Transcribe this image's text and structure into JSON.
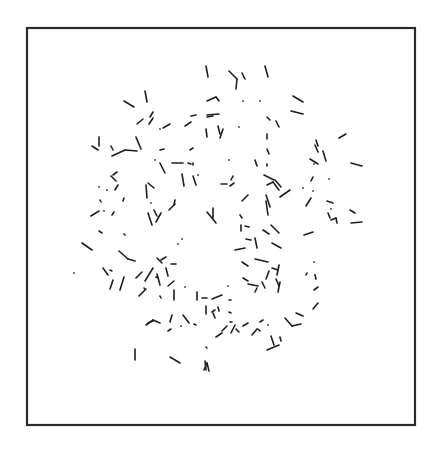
{
  "diagram": {
    "canvas": {
      "width": 430,
      "height": 449
    },
    "frame": {
      "x": 27,
      "y": 28,
      "width": 388,
      "height": 397,
      "stroke": "#2a2a2a"
    },
    "segment_color": "#1e1e1e",
    "segments": [
      [
        206,
        66,
        208,
        77
      ],
      [
        229,
        71,
        237,
        79
      ],
      [
        237,
        79,
        236,
        89
      ],
      [
        242,
        73,
        245,
        79
      ],
      [
        265,
        66,
        268,
        77
      ],
      [
        124,
        101,
        134,
        107
      ],
      [
        145,
        91,
        147,
        102
      ],
      [
        293,
        96,
        303,
        102
      ],
      [
        291,
        111,
        303,
        114
      ],
      [
        207,
        101,
        216,
        97
      ],
      [
        216,
        97,
        219,
        101
      ],
      [
        207,
        115,
        219,
        114
      ],
      [
        207,
        117,
        213,
        116
      ],
      [
        137,
        124,
        143,
        119
      ],
      [
        150,
        117,
        153,
        112
      ],
      [
        149,
        124,
        153,
        118
      ],
      [
        163,
        128,
        170,
        124
      ],
      [
        185,
        126,
        191,
        122
      ],
      [
        191,
        116,
        196,
        115
      ],
      [
        206,
        129,
        207,
        137
      ],
      [
        218,
        126,
        220,
        134
      ],
      [
        220,
        138,
        223,
        129
      ],
      [
        267,
        134,
        267,
        139
      ],
      [
        267,
        117,
        270,
        120
      ],
      [
        276,
        121,
        279,
        127
      ],
      [
        316,
        140,
        318,
        146
      ],
      [
        315,
        145,
        318,
        152
      ],
      [
        323,
        151,
        326,
        161
      ],
      [
        339,
        138,
        346,
        134
      ],
      [
        351,
        163,
        362,
        166
      ],
      [
        310,
        159,
        318,
        164
      ],
      [
        92,
        146,
        98,
        150
      ],
      [
        99,
        137,
        99,
        146
      ],
      [
        111,
        146,
        113,
        150
      ],
      [
        112,
        156,
        125,
        150
      ],
      [
        125,
        150,
        137,
        151
      ],
      [
        136,
        137,
        141,
        149
      ],
      [
        160,
        150,
        164,
        149
      ],
      [
        190,
        150,
        193,
        148
      ],
      [
        172,
        163,
        183,
        163
      ],
      [
        188,
        163,
        191,
        164
      ],
      [
        160,
        163,
        165,
        173
      ],
      [
        193,
        163,
        193,
        165
      ],
      [
        113,
        175,
        117,
        172
      ],
      [
        111,
        176,
        116,
        181
      ],
      [
        115,
        190,
        118,
        185
      ],
      [
        148,
        183,
        154,
        188
      ],
      [
        146,
        185,
        147,
        198
      ],
      [
        182,
        174,
        184,
        186
      ],
      [
        193,
        176,
        196,
        185
      ],
      [
        230,
        186,
        234,
        183
      ],
      [
        231,
        180,
        233,
        176
      ],
      [
        221,
        184,
        227,
        184
      ],
      [
        255,
        160,
        257,
        166
      ],
      [
        267,
        149,
        269,
        154
      ],
      [
        267,
        164,
        267,
        166
      ],
      [
        264,
        175,
        274,
        180
      ],
      [
        267,
        185,
        273,
        182
      ],
      [
        273,
        182,
        279,
        190
      ],
      [
        275,
        180,
        281,
        187
      ],
      [
        280,
        197,
        290,
        190
      ],
      [
        266,
        195,
        270,
        207
      ],
      [
        266,
        201,
        268,
        215
      ],
      [
        311,
        181,
        313,
        177
      ],
      [
        306,
        206,
        311,
        198
      ],
      [
        327,
        201,
        333,
        203
      ],
      [
        328,
        213,
        330,
        218
      ],
      [
        331,
        220,
        336,
        218
      ],
      [
        336,
        218,
        337,
        223
      ],
      [
        350,
        210,
        355,
        213
      ],
      [
        351,
        223,
        362,
        222
      ],
      [
        91,
        216,
        99,
        211
      ],
      [
        100,
        200,
        101,
        202
      ],
      [
        123,
        201,
        124,
        198
      ],
      [
        112,
        215,
        114,
        212
      ],
      [
        99,
        231,
        102,
        233
      ],
      [
        82,
        243,
        92,
        250
      ],
      [
        148,
        213,
        152,
        225
      ],
      [
        154,
        210,
        157,
        216
      ],
      [
        156,
        222,
        161,
        213
      ],
      [
        169,
        210,
        175,
        204
      ],
      [
        174,
        205,
        175,
        200
      ],
      [
        207,
        212,
        216,
        223
      ],
      [
        213,
        208,
        213,
        218
      ],
      [
        242,
        201,
        248,
        195
      ],
      [
        240,
        215,
        242,
        218
      ],
      [
        241,
        225,
        241,
        231
      ],
      [
        235,
        250,
        245,
        248
      ],
      [
        242,
        262,
        248,
        266
      ],
      [
        246,
        239,
        251,
        240
      ],
      [
        245,
        226,
        249,
        227
      ],
      [
        255,
        238,
        257,
        248
      ],
      [
        255,
        259,
        268,
        262
      ],
      [
        263,
        230,
        269,
        234
      ],
      [
        271,
        225,
        279,
        233
      ],
      [
        272,
        243,
        281,
        248
      ],
      [
        272,
        268,
        278,
        270
      ],
      [
        277,
        275,
        279,
        265
      ],
      [
        266,
        279,
        269,
        271
      ],
      [
        304,
        235,
        313,
        232
      ],
      [
        119,
        251,
        128,
        259
      ],
      [
        128,
        259,
        135,
        261
      ],
      [
        136,
        278,
        142,
        272
      ],
      [
        145,
        281,
        153,
        268
      ],
      [
        161,
        260,
        166,
        257
      ],
      [
        157,
        258,
        162,
        263
      ],
      [
        166,
        268,
        168,
        276
      ],
      [
        171,
        264,
        176,
        264
      ],
      [
        110,
        270,
        112,
        271
      ],
      [
        103,
        268,
        108,
        275
      ],
      [
        110,
        289,
        113,
        280
      ],
      [
        120,
        290,
        124,
        277
      ],
      [
        139,
        296,
        146,
        289
      ],
      [
        156,
        277,
        158,
        278
      ],
      [
        157,
        274,
        160,
        285
      ],
      [
        144,
        288,
        145,
        289
      ],
      [
        160,
        296,
        161,
        298
      ],
      [
        168,
        286,
        174,
        281
      ],
      [
        174,
        290,
        174,
        300
      ],
      [
        197,
        292,
        197,
        300
      ],
      [
        202,
        298,
        207,
        298
      ],
      [
        212,
        299,
        222,
        295
      ],
      [
        206,
        306,
        206,
        314
      ],
      [
        218,
        307,
        219,
        311
      ],
      [
        229,
        300,
        231,
        300
      ],
      [
        229,
        312,
        231,
        313
      ],
      [
        212,
        312,
        215,
        310
      ],
      [
        243,
        278,
        248,
        281
      ],
      [
        248,
        284,
        258,
        286
      ],
      [
        255,
        292,
        257,
        288
      ],
      [
        262,
        282,
        265,
        288
      ],
      [
        276,
        279,
        279,
        286
      ],
      [
        278,
        292,
        280,
        282
      ],
      [
        307,
        273,
        306,
        275
      ],
      [
        314,
        290,
        318,
        287
      ],
      [
        315,
        275,
        316,
        279
      ],
      [
        313,
        309,
        318,
        303
      ],
      [
        146,
        325,
        153,
        320
      ],
      [
        153,
        320,
        160,
        323
      ],
      [
        170,
        322,
        172,
        315
      ],
      [
        183,
        315,
        189,
        323
      ],
      [
        194,
        324,
        196,
        325
      ],
      [
        168,
        331,
        171,
        329
      ],
      [
        148,
        323,
        153,
        321
      ],
      [
        216,
        337,
        222,
        333
      ],
      [
        222,
        331,
        227,
        326
      ],
      [
        230,
        322,
        232,
        322
      ],
      [
        231,
        333,
        235,
        325
      ],
      [
        236,
        329,
        239,
        332
      ],
      [
        243,
        326,
        248,
        323
      ],
      [
        252,
        335,
        257,
        329
      ],
      [
        260,
        322,
        263,
        320
      ],
      [
        285,
        318,
        292,
        326
      ],
      [
        292,
        326,
        301,
        324
      ],
      [
        280,
        337,
        281,
        341
      ],
      [
        267,
        350,
        279,
        345
      ],
      [
        271,
        336,
        274,
        345
      ],
      [
        135,
        349,
        135,
        360
      ],
      [
        170,
        357,
        180,
        363
      ],
      [
        205,
        361,
        206,
        370
      ],
      [
        204,
        370,
        207,
        363
      ],
      [
        207,
        363,
        209,
        371
      ],
      [
        206,
        347,
        207,
        348
      ],
      [
        213,
        313,
        215,
        318
      ],
      [
        296,
        313,
        303,
        316
      ],
      [
        258,
        329,
        260,
        331
      ]
    ],
    "dots": [
      [
        74,
        273
      ],
      [
        99,
        187
      ],
      [
        104,
        211
      ],
      [
        124,
        234
      ],
      [
        107,
        190
      ],
      [
        151,
        203
      ],
      [
        125,
        235
      ],
      [
        178,
        244
      ],
      [
        185,
        287
      ],
      [
        181,
        326
      ],
      [
        182,
        239
      ],
      [
        198,
        175
      ],
      [
        260,
        101
      ],
      [
        314,
        164
      ],
      [
        303,
        188
      ],
      [
        313,
        191
      ],
      [
        331,
        209
      ],
      [
        329,
        179
      ],
      [
        314,
        262
      ],
      [
        315,
        275
      ],
      [
        229,
        160
      ],
      [
        243,
        101
      ],
      [
        239,
        127
      ],
      [
        155,
        160
      ],
      [
        160,
        129
      ],
      [
        228,
        286
      ],
      [
        268,
        325
      ]
    ]
  }
}
